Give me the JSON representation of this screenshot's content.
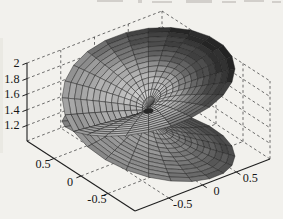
{
  "figure": {
    "background": "#f2f1ed",
    "paper_edge_tint": "#e3e1db",
    "axis_color": "#1f1f1f",
    "grid_color": "#3e3e3e",
    "label_color": "#161616",
    "label_font_px": 12.2
  },
  "chart_data": {
    "type": "surface3d-mesh",
    "function": {
      "z0": 1.5,
      "amplitude": 0.58,
      "theta0": -0.15,
      "r_max": 1,
      "turns": 2
    },
    "mesh": {
      "rings": 14,
      "spokes": 48
    },
    "axes": {
      "xlim": [
        -1,
        1
      ],
      "ylim": [
        -1,
        1
      ],
      "zlim": [
        1,
        2
      ],
      "x_ticks": [
        -0.5,
        0,
        0.5
      ],
      "x_tick_labels": [
        "-0.5",
        "0",
        "0.5"
      ],
      "y_ticks": [
        0.5,
        0,
        -0.5
      ],
      "y_tick_labels": [
        "0.5",
        "0",
        "-0.5"
      ],
      "z_ticks": [
        1.2,
        1.4,
        1.6,
        1.8,
        2
      ],
      "z_tick_labels": [
        "1.2",
        "1.4",
        "1.6",
        "1.8",
        "2"
      ],
      "grid": "on",
      "grid_style": "dashed",
      "box_top_z": 2
    },
    "projection": {
      "origin": [
        135,
        211
      ],
      "ux": [
        67.5,
        -26
      ],
      "uy": [
        -54,
        -35
      ],
      "uz": [
        0,
        -78
      ]
    },
    "shading": {
      "mesh_line_color": "#1d1d1d",
      "hole_color": "#262626",
      "stops": [
        [
          -1,
          0.27
        ],
        [
          -0.7,
          0.43
        ],
        [
          -0.4,
          0.58
        ],
        [
          -0.1,
          0.67
        ],
        [
          0.25,
          0.8
        ],
        [
          0.5,
          0.7
        ],
        [
          0.75,
          0.33
        ],
        [
          1,
          0.12
        ]
      ],
      "left_dim": 0.18
    }
  },
  "scan_artifacts": {
    "top_text_remnants": [
      [
        97,
        0,
        26,
        2
      ],
      [
        138,
        0,
        4,
        3
      ],
      [
        152,
        1,
        20,
        2
      ],
      [
        186,
        0,
        26,
        3
      ],
      [
        222,
        1,
        14,
        2
      ],
      [
        244,
        0,
        20,
        2
      ],
      [
        272,
        1,
        9,
        2
      ]
    ],
    "remnant_color": "#c9c7c2"
  }
}
